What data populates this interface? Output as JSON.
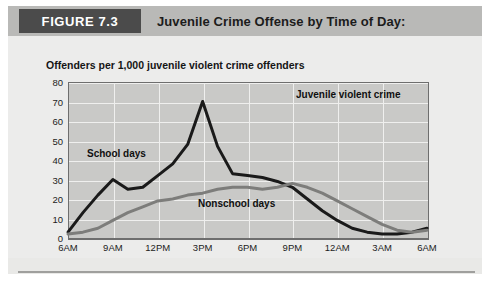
{
  "header": {
    "figure_tag": "FIGURE 7.3",
    "title": "Juvenile Crime Offense by Time of Day:"
  },
  "chart_data": {
    "type": "line",
    "title": "Juvenile Crime Offense by Time of Day:",
    "subtitle": "Offenders per 1,000 juvenile violent crime offenders",
    "xlabel": "",
    "ylabel": "Offenders per 1,000 juvenile violent crime offenders",
    "ylim": [
      0,
      80
    ],
    "yticks": [
      0,
      10,
      20,
      30,
      40,
      50,
      60,
      70,
      80
    ],
    "grid": true,
    "legend_position": "inline-annotations",
    "xtick_labels": [
      "6AM",
      "9AM",
      "12PM",
      "3PM",
      "6PM",
      "9PM",
      "12AM",
      "3AM",
      "6AM"
    ],
    "xtick_hours": [
      6,
      9,
      12,
      15,
      18,
      21,
      24,
      27,
      30
    ],
    "annotations": [
      {
        "text": "School days",
        "hour": 9.0,
        "value": 46
      },
      {
        "text": "Nonschool days",
        "hour": 16.2,
        "value": 17
      },
      {
        "text": "Juvenile violent crime",
        "hour": 23.5,
        "value": 72
      }
    ],
    "series": [
      {
        "name": "School days",
        "color": "#1a1a1a",
        "x": [
          6,
          7,
          8,
          9,
          10,
          11,
          12,
          13,
          14,
          15,
          16,
          17,
          18,
          19,
          20,
          21,
          22,
          23,
          24,
          25,
          26,
          27,
          28,
          29,
          30
        ],
        "values": [
          3,
          13,
          22,
          30,
          25,
          26,
          32,
          38,
          48,
          70,
          47,
          33,
          32,
          31,
          29,
          26,
          20,
          14,
          9,
          5,
          3,
          2,
          2,
          3,
          5
        ]
      },
      {
        "name": "Nonschool days",
        "color": "#7d7d7b",
        "x": [
          6,
          7,
          8,
          9,
          10,
          11,
          12,
          13,
          14,
          15,
          16,
          17,
          18,
          19,
          20,
          21,
          22,
          23,
          24,
          25,
          26,
          27,
          28,
          29,
          30
        ],
        "values": [
          2,
          3,
          5,
          9,
          13,
          16,
          19,
          20,
          22,
          23,
          25,
          26,
          26,
          25,
          26,
          28,
          26,
          23,
          19,
          15,
          11,
          7,
          4,
          3,
          4
        ]
      }
    ],
    "colors": {
      "plot_background": "#c9c9c7",
      "gridline": "#efefee",
      "axis": "#6e6e6e",
      "panel_background": "#ececeb",
      "header_band": "#b9b9b7",
      "figure_tag_background": "#4b4b4b",
      "figure_tag_text": "#ffffff"
    }
  }
}
